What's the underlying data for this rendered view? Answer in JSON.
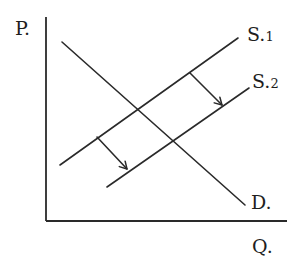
{
  "diagram": {
    "type": "supply-demand",
    "axes": {
      "y_label": "P.",
      "x_label": "Q."
    },
    "curves": [
      {
        "id": "demand",
        "label": "D.",
        "x1": 62,
        "y1": 42,
        "x2": 245,
        "y2": 205
      },
      {
        "id": "supply1",
        "label_main": "S.",
        "label_sub": "1",
        "x1": 60,
        "y1": 165,
        "x2": 238,
        "y2": 38
      },
      {
        "id": "supply2",
        "label_main": "S.",
        "label_sub": "2",
        "x1": 107,
        "y1": 187,
        "x2": 249,
        "y2": 88
      }
    ],
    "shift_arrows": [
      {
        "from": [
          97,
          137
        ],
        "to": [
          127,
          169
        ]
      },
      {
        "from": [
          190,
          73
        ],
        "to": [
          222,
          105
        ]
      }
    ],
    "colors": {
      "ink": "#2a2a2a",
      "background": "#ffffff"
    }
  },
  "labels": {
    "p": "P.",
    "q": "Q.",
    "d": "D.",
    "s1_main": "S.",
    "s1_sub": "1",
    "s2_main": "S.",
    "s2_sub": "2"
  }
}
